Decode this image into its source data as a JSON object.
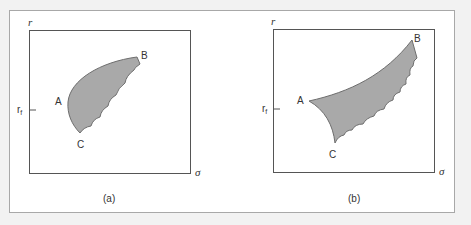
{
  "figure": {
    "panels": [
      {
        "id": "a",
        "caption": "(a)",
        "y_axis_label": "r",
        "x_axis_label": "σ",
        "tick_label": "r",
        "tick_sub": "f",
        "points": {
          "A": "A",
          "B": "B",
          "C": "C"
        }
      },
      {
        "id": "b",
        "caption": "(b)",
        "y_axis_label": "r",
        "x_axis_label": "σ",
        "tick_label": "r",
        "tick_sub": "f",
        "points": {
          "A": "A",
          "B": "B",
          "C": "C"
        }
      }
    ],
    "colors": {
      "region_fill": "#a9a9a9",
      "region_stroke": "#6e6e6e",
      "axis": "#555555",
      "background": "#f2f2f2"
    }
  }
}
